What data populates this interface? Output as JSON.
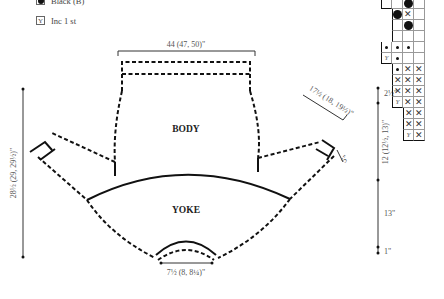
{
  "legend": {
    "items": [
      {
        "symbol": "large-dot",
        "label": "Black (B)"
      },
      {
        "symbol": "inc",
        "glyph": "Y",
        "label": "Inc 1 st"
      }
    ]
  },
  "schematic": {
    "pieces": {
      "body": "BODY",
      "yoke": "YOKE"
    },
    "measurements": {
      "body_width": "44 (47, 50)\"",
      "sleeve_length": "17½ (18, 19½)\"",
      "cuff": "5\"",
      "total_length": "28½ (29, 29½)\"",
      "neck_width": "7½ (8, 8¼)\"",
      "right_seg_1": "2½\"",
      "right_seg_2": "12 (12½, 13)\"",
      "right_seg_3": "13\"",
      "right_seg_4": "1\""
    }
  },
  "chart": {
    "rows": [
      [
        "",
        "Y",
        "",
        "",
        ""
      ],
      [
        "",
        "",
        "",
        "big",
        ""
      ],
      [
        "",
        "",
        "big",
        "X",
        ""
      ],
      [
        "",
        "",
        "",
        "big",
        ""
      ],
      [
        "",
        "sm",
        "",
        "",
        ""
      ],
      [
        "",
        "sm",
        "sm",
        "sm",
        ""
      ],
      [
        "",
        "Y",
        "sm",
        "",
        ""
      ],
      [
        "",
        "",
        "sm",
        "X",
        "X"
      ],
      [
        "",
        "",
        "X",
        "X",
        "X"
      ],
      [
        "",
        "",
        "X",
        "X",
        "X"
      ],
      [
        "",
        "",
        "Y",
        "X",
        "X"
      ],
      [
        "",
        "",
        "",
        "X",
        "X"
      ],
      [
        "",
        "",
        "",
        "X",
        "X"
      ],
      [
        "",
        "",
        "",
        "Y",
        "X"
      ]
    ]
  },
  "colors": {
    "line": "#111111",
    "label": "#555555",
    "grid": "#999999"
  }
}
